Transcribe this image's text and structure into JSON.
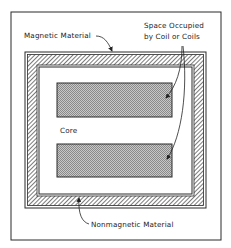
{
  "diagram": {
    "labels": {
      "magnetic_material": "Magnetic Material",
      "space_line1": "Space Occupied",
      "space_line2": "by Coil or Coils",
      "core": "Core",
      "nonmagnetic_material": "Nonmagnetic Material"
    },
    "colors": {
      "line": "#2a2a2a",
      "background": "#ffffff",
      "hatch": "#3a3a3a",
      "coil_fill": "#bdbdbd"
    }
  }
}
